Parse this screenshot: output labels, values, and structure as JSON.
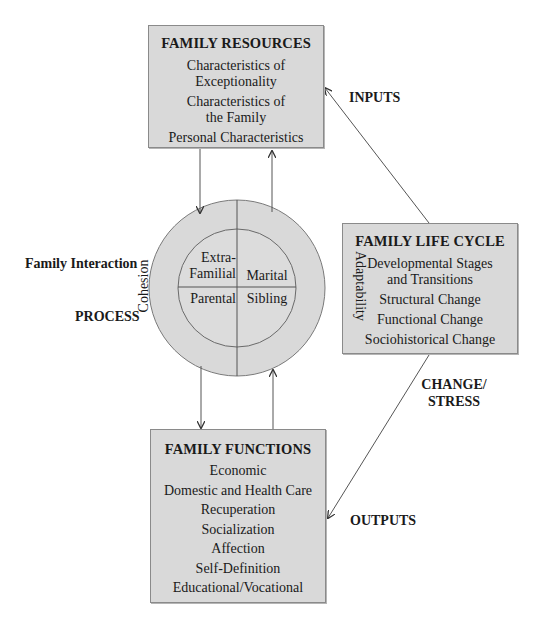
{
  "diagram": {
    "colors": {
      "box_fill": "#d9d9d9",
      "box_border": "#8a8a8a",
      "line": "#555555",
      "text": "#1a1a1a"
    },
    "family_resources": {
      "title": "FAMILY RESOURCES",
      "items": [
        "Characteristics of\nExceptionality",
        "Characteristics of\nthe Family",
        "Personal Characteristics"
      ]
    },
    "family_life_cycle": {
      "title": "FAMILY LIFE CYCLE",
      "items": [
        "Developmental Stages\nand Transitions",
        "Structural Change",
        "Functional Change",
        "Sociohistorical Change"
      ]
    },
    "family_functions": {
      "title": "FAMILY FUNCTIONS",
      "items": [
        "Economic",
        "Domestic and Health Care",
        "Recuperation",
        "Socialization",
        "Affection",
        "Self-Definition",
        "Educational/Vocational"
      ]
    },
    "family_interaction": {
      "label": "Family Interaction",
      "outer_left": "Cohesion",
      "outer_right": "Adaptability",
      "quadrants": {
        "top_left": "Extra-\nFamilial",
        "top_right": "Marital",
        "bottom_left": "Parental",
        "bottom_right": "Sibling"
      }
    },
    "labels": {
      "process": "PROCESS",
      "inputs": "INPUTS",
      "change_stress": "CHANGE/\nSTRESS",
      "outputs": "OUTPUTS"
    }
  }
}
